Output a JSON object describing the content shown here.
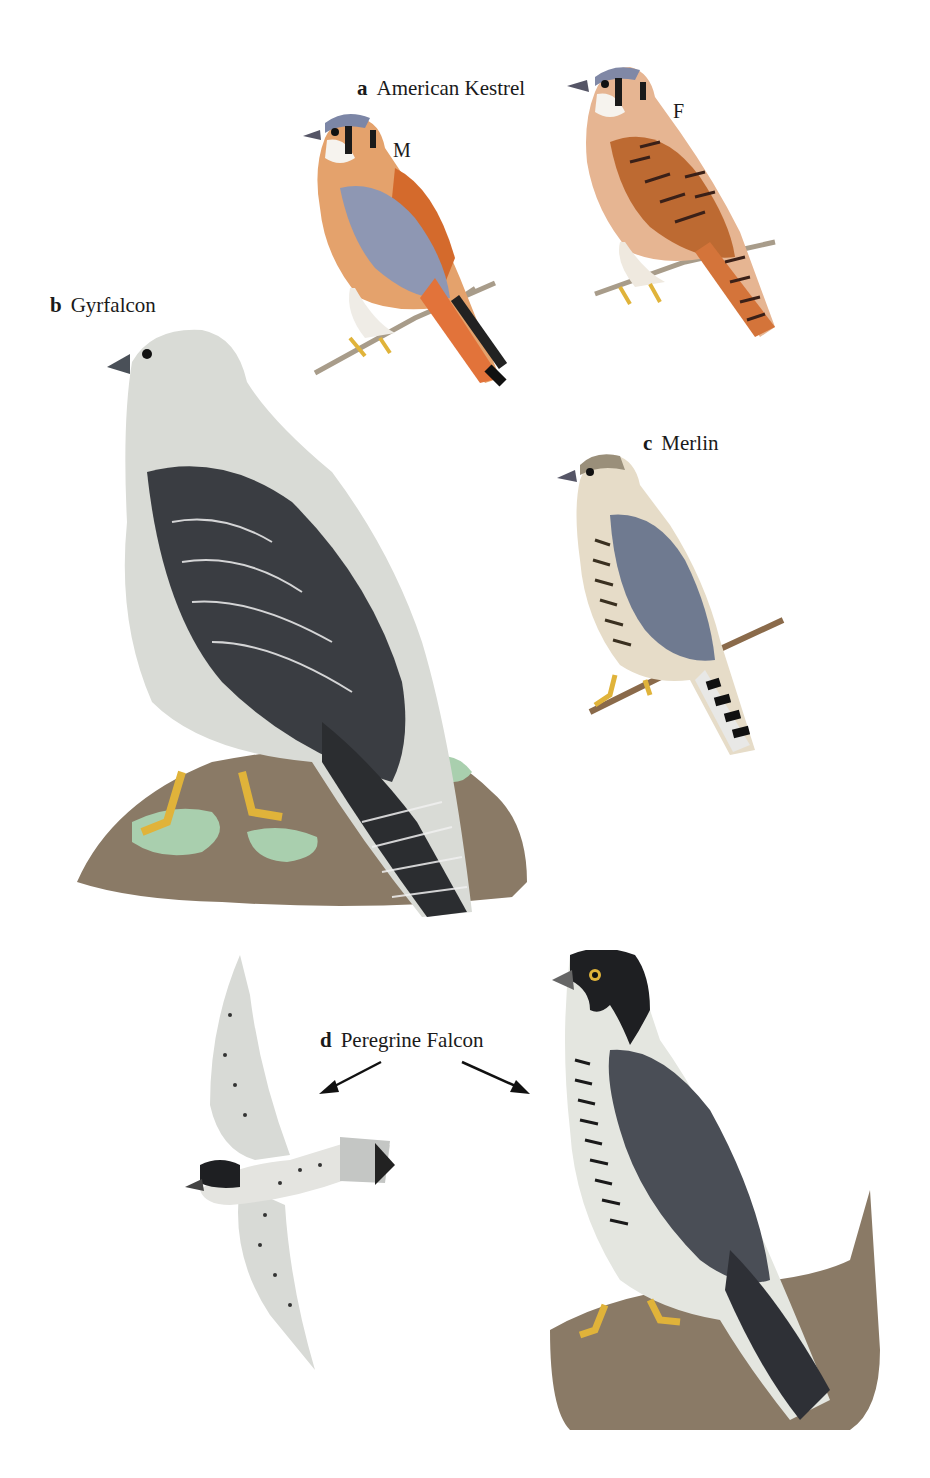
{
  "plate": {
    "species": [
      {
        "letter": "a",
        "name": "American Kestrel",
        "sexes": {
          "male": "M",
          "female": "F"
        }
      },
      {
        "letter": "b",
        "name": "Gyrfalcon"
      },
      {
        "letter": "c",
        "name": "Merlin"
      },
      {
        "letter": "d",
        "name": "Peregrine Falcon"
      }
    ]
  },
  "colors": {
    "kestrel_rufous": "#d9743a",
    "kestrel_blue": "#8e97b3",
    "gyr_dark": "#3a3d42",
    "merlin_blue": "#6f7a90",
    "peregrine_hood": "#1e1f22",
    "rock": "#8a7a66",
    "lichen": "#a9cfae",
    "legs": "#e0b33a"
  }
}
